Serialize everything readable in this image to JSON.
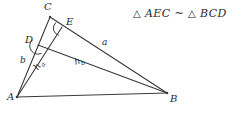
{
  "figure": {
    "type": "geometry-diagram",
    "background_color": "#ffffff",
    "stroke_color": "#3a3a3a",
    "text_color": "#2b2b2b"
  },
  "statement": {
    "triangle_symbol": "△",
    "similar_symbol": "~",
    "left_triangle": "AEC",
    "right_triangle": "BCD",
    "full_text": "△ AEC ~ △ BCD"
  },
  "points": {
    "A": {
      "label": "A",
      "x": 17,
      "y": 97,
      "label_x": 9,
      "label_y": 97
    },
    "B": {
      "label": "B",
      "x": 167,
      "y": 93,
      "label_x": 170,
      "label_y": 95
    },
    "C": {
      "label": "C",
      "x": 50,
      "y": 17,
      "label_x": 44,
      "label_y": 3
    },
    "D": {
      "label": "D",
      "x": 38,
      "y": 45,
      "label_x": 25,
      "label_y": 38
    },
    "E": {
      "label": "E",
      "x": 62,
      "y": 27,
      "label_x": 66,
      "label_y": 19
    }
  },
  "segments": [
    {
      "name": "side-c-AB",
      "from": "A",
      "to": "B"
    },
    {
      "name": "side-b-AC",
      "from": "A",
      "to": "C"
    },
    {
      "name": "side-a-CB",
      "from": "C",
      "to": "B"
    },
    {
      "name": "altitude-ha-AE",
      "from": "A",
      "to": "E"
    },
    {
      "name": "altitude-hb-BD",
      "from": "B",
      "to": "D"
    }
  ],
  "labels": {
    "side_a": {
      "text": "a",
      "x": 103,
      "y": 40
    },
    "side_b": {
      "text": "b",
      "x": 21,
      "y": 61
    },
    "altitude_ha": {
      "base": "h",
      "sub": "a",
      "x": 38,
      "y": 70,
      "rotation": -56
    },
    "altitude_hb": {
      "base": "h",
      "sub": "b",
      "x": 76,
      "y": 62,
      "rotation": -20
    }
  },
  "angle_marks": [
    {
      "name": "right-angle-at-E",
      "vertex": "E",
      "cx": 62,
      "cy": 27,
      "radius": 9
    },
    {
      "name": "right-angle-at-D",
      "vertex": "D",
      "cx": 38,
      "cy": 45,
      "radius": 9
    }
  ]
}
